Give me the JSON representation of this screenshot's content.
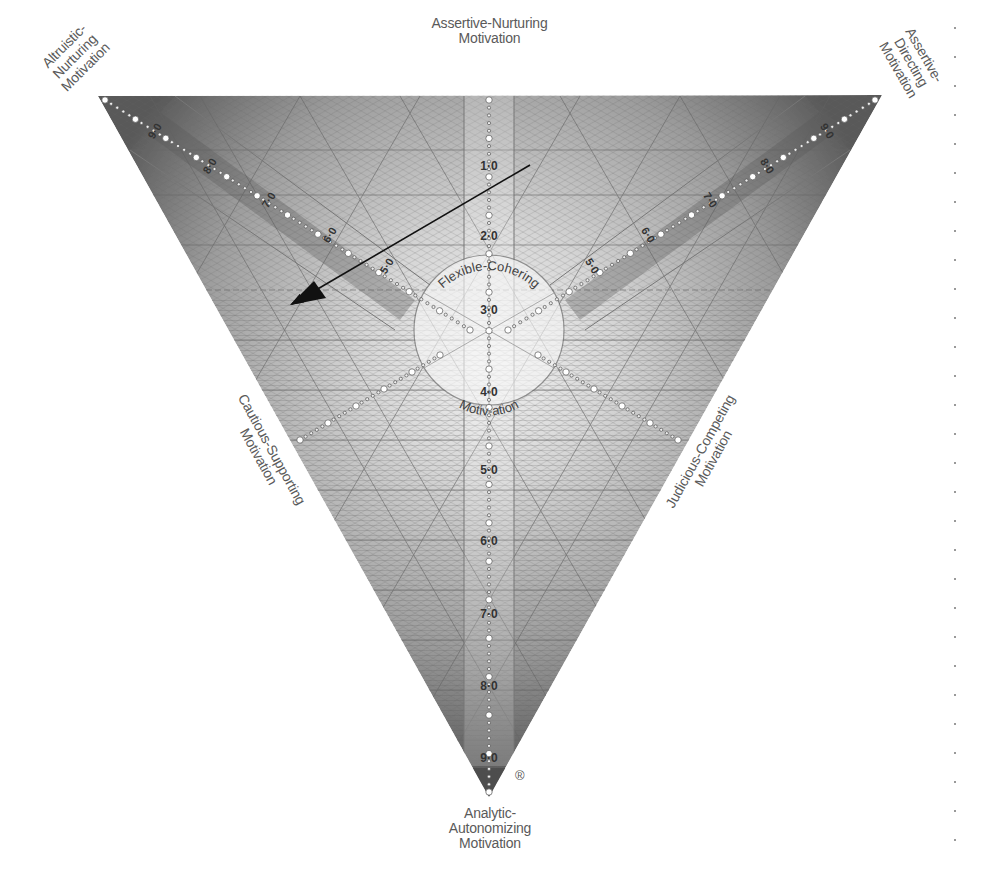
{
  "diagram": {
    "colors": {
      "background": "#ffffff",
      "triangle_dark": "#5c5c5c",
      "triangle_mid": "#a8a8a8",
      "triangle_light": "#e6e6e6",
      "grid_line": "#6e6e6e",
      "arrow": "#111111",
      "text": "#5a5a5a"
    },
    "labels": {
      "top_center": [
        "Assertive-Nurturing",
        "Motivation"
      ],
      "top_left": [
        "Altruistic-",
        "Nurturing",
        "Motivation"
      ],
      "top_right": [
        "Assertive-",
        "Directing",
        "Motivation"
      ],
      "left_side": [
        "Cautious-Supporting",
        "Motivation"
      ],
      "right_side": [
        "Judicious-Competing",
        "Motivation"
      ],
      "bottom": [
        "Analytic-",
        "Autonomizing",
        "Motivation"
      ],
      "center_top": "Flexible-Cohering",
      "center_bottom": "Motiv-ation",
      "registered_mark": "®"
    },
    "vertical_scale": [
      "1·0",
      "2·0",
      "3·0",
      "4·0",
      "5·0",
      "6·0",
      "7·0",
      "8·0",
      "9·0"
    ],
    "right_arm_scale": [
      "5·0",
      "6·0",
      "7·0",
      "8·0",
      "9·0"
    ],
    "left_arm_scale": [
      "5·0",
      "6·0",
      "7·0",
      "8·0",
      "9·0"
    ],
    "arrow": {
      "from": [
        530,
        165
      ],
      "to": [
        290,
        305
      ]
    },
    "vertices": {
      "top_left": [
        98,
        96
      ],
      "top_right": [
        882,
        95
      ],
      "bottom": [
        489,
        797
      ]
    },
    "center": [
      489,
      355
    ],
    "center_radius": 75,
    "edge_dot_count": 29
  }
}
